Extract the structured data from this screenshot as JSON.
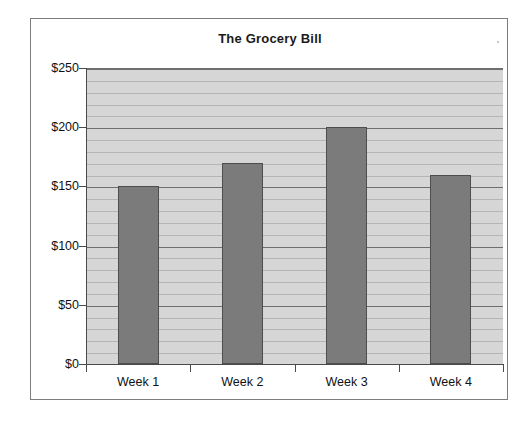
{
  "chart_data": {
    "type": "bar",
    "title": "The Grocery Bill",
    "categories": [
      "Week 1",
      "Week 2",
      "Week 3",
      "Week 4"
    ],
    "values": [
      150,
      170,
      200,
      160
    ],
    "series": [
      {
        "name": "Grocery Bill",
        "values": [
          150,
          170,
          200,
          160
        ]
      }
    ],
    "xlabel": "",
    "ylabel": "",
    "ylim": [
      0,
      250
    ],
    "y_ticks": [
      0,
      50,
      100,
      150,
      200,
      250
    ],
    "y_tick_labels": [
      "$0",
      "$50",
      "$100",
      "$150",
      "$200",
      "$250"
    ],
    "y_minor_interval": 10,
    "grid": true,
    "grid_orientation": "horizontal",
    "legend": false,
    "legend_position": "none",
    "currency": "USD",
    "colors": {
      "bar_fill": "#7b7b7b",
      "bar_border": "#4d4d4d",
      "plot_background": "#d6d6d6",
      "major_gridline": "#6f6f6f",
      "minor_gridline": "#b5b5b5",
      "axis": "#4a4a4a",
      "frame_border": "#7d7d7d",
      "text": "#111111",
      "page_background": "#ffffff"
    }
  }
}
